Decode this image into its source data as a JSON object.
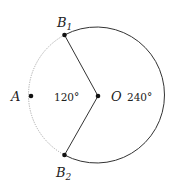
{
  "diagram": {
    "points": {
      "B1": {
        "name": "B",
        "sub": "1"
      },
      "B2": {
        "name": "B",
        "sub": "2"
      },
      "A": {
        "name": "A"
      },
      "O": {
        "name": "O"
      }
    },
    "angles": {
      "minor": "120°",
      "major": "240°"
    },
    "colors": {
      "solid_arc": "#333333",
      "dotted_arc": "#aaaaaa",
      "points": "#111111"
    }
  }
}
